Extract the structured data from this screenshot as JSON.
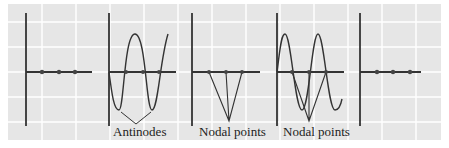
{
  "figure": {
    "background_color": "#e6e6e6",
    "grid_color": "#ffffff",
    "line_color": "#333333",
    "panels": [
      {
        "id": 1,
        "state": "flat string, nodes marked"
      },
      {
        "id": 2,
        "state": "maximum displacement, full sine"
      },
      {
        "id": 3,
        "state": "triangular displacement"
      },
      {
        "id": 4,
        "state": "two overlaid waves"
      },
      {
        "id": 5,
        "state": "flat string, nodes marked"
      }
    ],
    "labels": {
      "antinodes": "Antinodes",
      "nodal_points_1": "Nodal points",
      "nodal_points_2": "Nodal points"
    }
  }
}
